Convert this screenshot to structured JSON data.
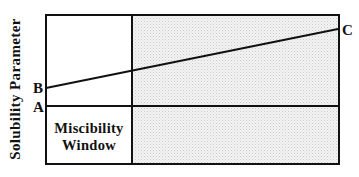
{
  "diagram": {
    "y_axis_label": "Solubility Parameter",
    "points": {
      "a": "A",
      "b": "B",
      "c": "C"
    },
    "region_label_line1": "Miscibility",
    "region_label_line2": "Window",
    "colors": {
      "line": "#111111",
      "shade": "#e9e9e9",
      "background": "#ffffff"
    },
    "elements": [
      {
        "name": "line-a",
        "description": "horizontal line at solubility parameter A across full width"
      },
      {
        "name": "line-b-c",
        "description": "rising line from B (left) to C (right)"
      },
      {
        "name": "miscibility-window",
        "description": "unshaded region below line A, left of divider"
      },
      {
        "name": "shaded-region",
        "description": "stippled region right of divider"
      }
    ]
  }
}
